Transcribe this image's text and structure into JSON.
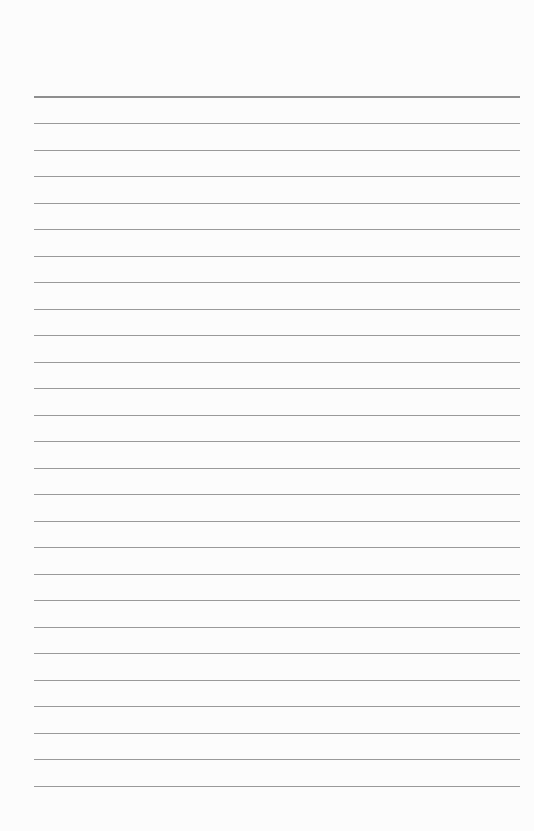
{
  "page": {
    "type": "lined-notebook-page",
    "background_color": "#fcfcfc",
    "line_color": "#9a9a9a",
    "header_line_color": "#8e8e8e",
    "header_line_y": 96,
    "line_start_y": 123,
    "line_spacing": 26.52,
    "line_count": 26,
    "line_left": 34,
    "line_width": 486
  }
}
